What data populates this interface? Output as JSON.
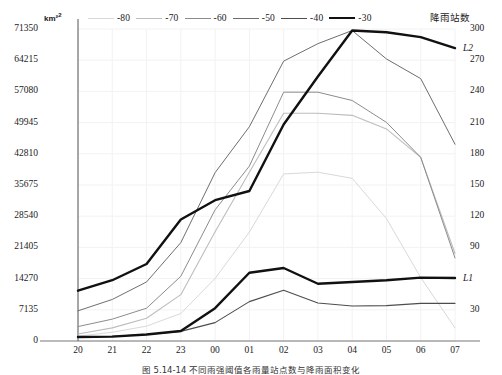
{
  "chart_data": {
    "type": "line",
    "title": "",
    "caption": "图 5.14-14  不同雨强阈值各雨量站点数与降雨面积变化",
    "xlabel": "",
    "ylabel": "km²",
    "y2label": "降雨站数",
    "x": [
      "20",
      "21",
      "22",
      "23",
      "00",
      "01",
      "02",
      "03",
      "04",
      "05",
      "06",
      "07"
    ],
    "ylim": [
      0,
      71350
    ],
    "yticks": [
      0,
      7135,
      14270,
      21405,
      28540,
      35675,
      42810,
      49945,
      57080,
      64215,
      71350
    ],
    "y2lim": [
      0,
      300
    ],
    "y2ticks": [
      30,
      90,
      120,
      150,
      180,
      210,
      240,
      270,
      300
    ],
    "grid": true,
    "legend_position": "top",
    "series": [
      {
        "name": "-80",
        "color": "#d9d9d9",
        "width": 1.0,
        "axis": "left",
        "values": [
          1100,
          2000,
          3400,
          6300,
          14300,
          24900,
          38200,
          38600,
          37200,
          28000,
          14500,
          3000
        ]
      },
      {
        "name": "-70",
        "color": "#bdbdbd",
        "width": 1.1,
        "axis": "left",
        "values": [
          1600,
          3000,
          5200,
          10600,
          25000,
          38600,
          52100,
          52100,
          51600,
          48500,
          42000,
          20000
        ]
      },
      {
        "name": "-60",
        "color": "#8c8c8c",
        "width": 1.0,
        "axis": "left",
        "values": [
          3300,
          5000,
          7500,
          14800,
          30000,
          40000,
          56900,
          56900,
          55000,
          50000,
          42000,
          19000
        ]
      },
      {
        "name": "-50",
        "color": "#6e6e6e",
        "width": 1.0,
        "axis": "left",
        "values": [
          6900,
          9500,
          13500,
          22500,
          38500,
          49000,
          64000,
          68000,
          71000,
          64500,
          60000,
          45000
        ]
      },
      {
        "name": "-40",
        "color": "#4d4d4d",
        "width": 1.1,
        "axis": "left",
        "values": [
          900,
          1100,
          1500,
          2200,
          4200,
          9000,
          11600,
          8700,
          8000,
          8100,
          8600,
          8600
        ]
      },
      {
        "name": "-30",
        "color": "#111111",
        "width": 2.4,
        "axis": "left",
        "values": [
          11500,
          13900,
          17600,
          27800,
          32200,
          34300,
          49500,
          60500,
          71000,
          70600,
          69500,
          67000
        ]
      },
      {
        "name": "L1",
        "color": "#111111",
        "width": 2.4,
        "axis": "left",
        "values": [
          900,
          1000,
          1500,
          2300,
          7500,
          15600,
          16700,
          13100,
          13500,
          13900,
          14500,
          14400
        ]
      }
    ],
    "annotations": [
      {
        "text": "L2",
        "x": "07",
        "axis": "left",
        "value": 67000
      },
      {
        "text": "L1",
        "x": "07",
        "axis": "left",
        "value": 14400
      }
    ]
  }
}
